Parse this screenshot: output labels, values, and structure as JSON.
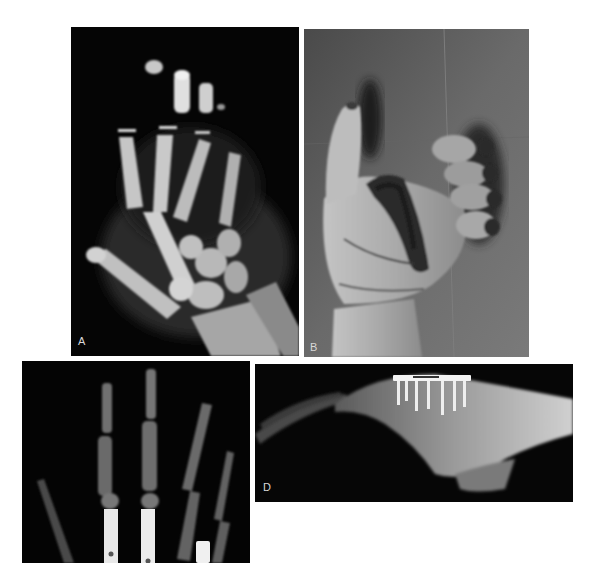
{
  "figure": {
    "panels": [
      {
        "id": "A",
        "label": "A",
        "kind": "radiograph",
        "view": "PA hand, pre-operative"
      },
      {
        "id": "B",
        "label": "B",
        "kind": "clinical-photograph",
        "view": "injured hand, palmar"
      },
      {
        "id": "C",
        "kind": "radiograph",
        "view": "PA hand, post-operative with intramedullary fixation"
      },
      {
        "id": "D",
        "label": "D",
        "kind": "radiograph",
        "view": "lateral hand, post-operative with plate and screws"
      }
    ]
  }
}
